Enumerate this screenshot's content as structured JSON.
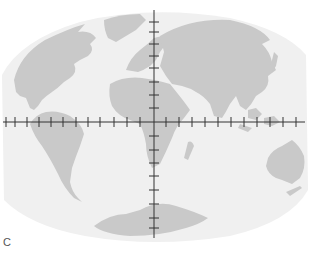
{
  "figure": {
    "panel_label": "C",
    "projection": "pseudocylindrical world map (Atlantic-centered)",
    "colors": {
      "background": "#ffffff",
      "ocean": "#f0f0f0",
      "land": "#c9c9c9",
      "axis": "#333333"
    },
    "axes": {
      "horizontal": {
        "y": 122,
        "x_start": 3,
        "x_end": 305,
        "tick_x": [
          6,
          15,
          27,
          39,
          51,
          63,
          76,
          88,
          100,
          114,
          127,
          140,
          166,
          179,
          192,
          205,
          218,
          231,
          244,
          257,
          270,
          283,
          296
        ]
      },
      "vertical": {
        "x": 154,
        "y_start": 10,
        "y_end": 238,
        "tick_y": [
          22,
          32,
          44,
          56,
          68,
          82,
          95,
          108,
          136,
          150,
          163,
          176,
          190,
          204,
          218,
          228
        ]
      }
    },
    "landmasses": [
      "North America",
      "Greenland",
      "South America",
      "Europe",
      "Africa",
      "Asia",
      "Madagascar",
      "Southeast Asia",
      "Australia",
      "New Zealand",
      "Antarctica"
    ]
  }
}
